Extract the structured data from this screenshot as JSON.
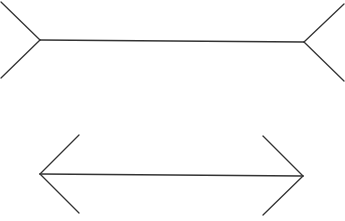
{
  "diagram": {
    "title": "",
    "stroke_color": "#333333",
    "background": "#ffffff",
    "figures": [
      {
        "name": "fins-out-line",
        "shaft": {
          "x1": 40,
          "y1": 40,
          "x2": 304,
          "y2": 42
        },
        "fins": [
          {
            "x1": 40,
            "y1": 40,
            "x2": 1,
            "y2": 2
          },
          {
            "x1": 40,
            "y1": 40,
            "x2": 1,
            "y2": 78
          },
          {
            "x1": 304,
            "y1": 42,
            "x2": 344,
            "y2": 4
          },
          {
            "x1": 304,
            "y1": 42,
            "x2": 344,
            "y2": 81
          }
        ]
      },
      {
        "name": "fins-in-line",
        "shaft": {
          "x1": 40,
          "y1": 174,
          "x2": 303,
          "y2": 176
        },
        "fins": [
          {
            "x1": 40,
            "y1": 174,
            "x2": 79,
            "y2": 135
          },
          {
            "x1": 40,
            "y1": 174,
            "x2": 79,
            "y2": 213
          },
          {
            "x1": 303,
            "y1": 176,
            "x2": 263,
            "y2": 136
          },
          {
            "x1": 303,
            "y1": 176,
            "x2": 263,
            "y2": 215
          }
        ]
      }
    ]
  }
}
